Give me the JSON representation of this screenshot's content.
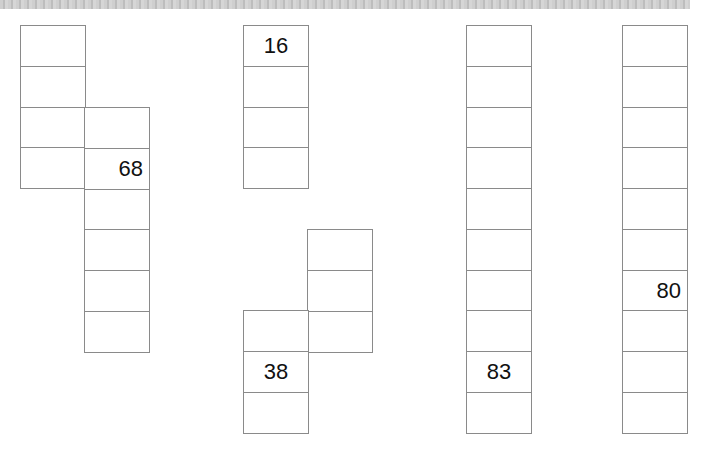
{
  "figure": {
    "groups": [
      {
        "id": "A",
        "strips": [
          {
            "x": 20,
            "top": 25,
            "count": 4,
            "labels": {}
          },
          {
            "x": 84,
            "top": 107,
            "count": 6,
            "labels": {
              "1": {
                "text": "68",
                "align": "right"
              }
            }
          }
        ]
      },
      {
        "id": "B",
        "strips": [
          {
            "x": 243,
            "top": 25,
            "count": 4,
            "labels": {
              "0": {
                "text": "16",
                "align": "center"
              }
            }
          },
          {
            "x": 307,
            "top": 229,
            "count": 3,
            "labels": {}
          },
          {
            "x": 243,
            "top": 310,
            "count": 3,
            "labels": {
              "1": {
                "text": "38",
                "align": "center"
              }
            }
          }
        ]
      },
      {
        "id": "C",
        "strips": [
          {
            "x": 466,
            "top": 25,
            "count": 10,
            "labels": {
              "8": {
                "text": "83",
                "align": "center"
              }
            }
          }
        ]
      },
      {
        "id": "D",
        "strips": [
          {
            "x": 622,
            "top": 25,
            "count": 10,
            "labels": {
              "6": {
                "text": "80",
                "align": "right"
              }
            }
          }
        ]
      }
    ],
    "cell_width": 65,
    "cell_height": 40.75,
    "border_color": "#8a8a8a"
  }
}
